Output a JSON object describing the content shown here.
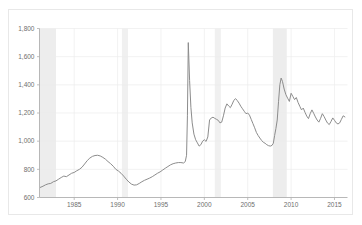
{
  "figure": {
    "background_color": "#ffffff",
    "frame_color": "#e8e8e8"
  },
  "chart_data": {
    "type": "line",
    "title": "",
    "subtitle": "",
    "xlabel": "",
    "ylabel": "",
    "xlim": [
      1981.0,
      2016.5
    ],
    "ylim": [
      600,
      1800
    ],
    "grid": true,
    "grid_color": "#ededed",
    "legend": null,
    "legend_position": "none",
    "line_color": "#8c8c8c",
    "line_width": 1.0,
    "axis_color": "#b0b0b0",
    "tick_label_color": "#6e6e6e",
    "xticks": [
      1985,
      1990,
      1995,
      2000,
      2005,
      2010,
      2015
    ],
    "xtick_labels": [
      "1985",
      "1990",
      "1995",
      "2000",
      "2005",
      "2010",
      "2015"
    ],
    "yticks": [
      600,
      800,
      1000,
      1200,
      1400,
      1600,
      1800
    ],
    "ytick_labels": [
      "600",
      "800",
      "1,000",
      "1,200",
      "1,400",
      "1,600",
      "1,800"
    ],
    "shaded_bands": [
      {
        "name": "recession-1981-1982",
        "x0": 1981.0,
        "x1": 1982.9,
        "color": "#ededed"
      },
      {
        "name": "recession-1990-1991",
        "x0": 1990.5,
        "x1": 1991.2,
        "color": "#f0f0f0"
      },
      {
        "name": "recession-2001",
        "x0": 2001.2,
        "x1": 2001.9,
        "color": "#f0f0f0"
      },
      {
        "name": "recession-2007-2009",
        "x0": 2007.9,
        "x1": 2009.5,
        "color": "#ededed"
      }
    ],
    "series": [
      {
        "name": "series-1",
        "color": "#8c8c8c",
        "x": [
          1981.1,
          1981.4,
          1981.7,
          1982.0,
          1982.3,
          1982.6,
          1982.9,
          1983.2,
          1983.5,
          1983.8,
          1984.1,
          1984.4,
          1984.7,
          1985.0,
          1985.3,
          1985.6,
          1985.9,
          1986.2,
          1986.5,
          1986.8,
          1987.1,
          1987.4,
          1987.7,
          1988.0,
          1988.3,
          1988.6,
          1988.9,
          1989.2,
          1989.5,
          1989.8,
          1990.1,
          1990.4,
          1990.7,
          1991.0,
          1991.3,
          1991.6,
          1991.9,
          1992.2,
          1992.5,
          1992.8,
          1993.1,
          1993.4,
          1993.7,
          1994.0,
          1994.3,
          1994.6,
          1994.9,
          1995.2,
          1995.5,
          1995.8,
          1996.1,
          1996.4,
          1996.7,
          1997.0,
          1997.3,
          1997.6,
          1997.8,
          1997.95,
          1998.05,
          1998.15,
          1998.3,
          1998.45,
          1998.6,
          1998.8,
          1999.0,
          1999.2,
          1999.4,
          1999.6,
          1999.8,
          2000.0,
          2000.2,
          2000.4,
          2000.6,
          2000.8,
          2001.0,
          2001.2,
          2001.4,
          2001.6,
          2001.8,
          2002.0,
          2002.2,
          2002.4,
          2002.6,
          2002.8,
          2003.0,
          2003.2,
          2003.4,
          2003.6,
          2003.8,
          2004.0,
          2004.2,
          2004.4,
          2004.6,
          2004.8,
          2005.0,
          2005.2,
          2005.4,
          2005.6,
          2005.8,
          2006.0,
          2006.2,
          2006.4,
          2006.6,
          2006.8,
          2007.0,
          2007.2,
          2007.4,
          2007.6,
          2007.8,
          2007.95,
          2008.1,
          2008.25,
          2008.4,
          2008.55,
          2008.7,
          2008.85,
          2009.0,
          2009.2,
          2009.4,
          2009.6,
          2009.8,
          2010.0,
          2010.2,
          2010.4,
          2010.6,
          2010.8,
          2011.0,
          2011.2,
          2011.4,
          2011.6,
          2011.8,
          2012.0,
          2012.2,
          2012.4,
          2012.6,
          2012.8,
          2013.0,
          2013.2,
          2013.4,
          2013.6,
          2013.8,
          2014.0,
          2014.2,
          2014.4,
          2014.6,
          2014.8,
          2015.0,
          2015.2,
          2015.4,
          2015.6,
          2015.8,
          2016.0,
          2016.2
        ],
        "y": [
          672,
          680,
          690,
          697,
          700,
          712,
          718,
          730,
          742,
          752,
          748,
          760,
          772,
          778,
          790,
          800,
          815,
          838,
          862,
          880,
          892,
          898,
          900,
          895,
          885,
          872,
          855,
          840,
          822,
          800,
          788,
          772,
          752,
          730,
          710,
          695,
          688,
          690,
          700,
          712,
          722,
          730,
          738,
          748,
          760,
          772,
          782,
          795,
          808,
          820,
          832,
          840,
          845,
          848,
          848,
          845,
          855,
          900,
          1180,
          1700,
          1430,
          1240,
          1130,
          1050,
          1010,
          988,
          965,
          975,
          1000,
          1010,
          998,
          1030,
          1150,
          1165,
          1170,
          1162,
          1155,
          1148,
          1130,
          1135,
          1180,
          1235,
          1265,
          1250,
          1238,
          1262,
          1290,
          1302,
          1288,
          1270,
          1248,
          1230,
          1212,
          1195,
          1200,
          1185,
          1155,
          1125,
          1095,
          1062,
          1040,
          1022,
          1005,
          992,
          985,
          975,
          968,
          965,
          970,
          985,
          1040,
          1090,
          1150,
          1280,
          1400,
          1448,
          1425,
          1370,
          1330,
          1305,
          1282,
          1340,
          1318,
          1295,
          1310,
          1275,
          1248,
          1222,
          1235,
          1205,
          1178,
          1160,
          1195,
          1222,
          1198,
          1172,
          1150,
          1135,
          1162,
          1195,
          1175,
          1150,
          1128,
          1118,
          1140,
          1165,
          1148,
          1130,
          1122,
          1130,
          1155,
          1180,
          1172
        ]
      }
    ]
  }
}
